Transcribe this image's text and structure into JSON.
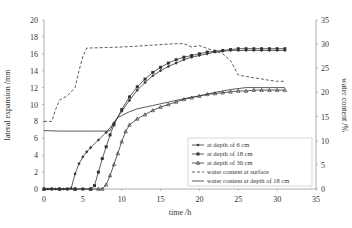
{
  "chart_data": {
    "type": "line",
    "title": "",
    "xlabel": "time /h",
    "ylabel": "lateral expansion /mm",
    "y2label": "water content /%",
    "xlim": [
      0,
      35
    ],
    "ylim": [
      0,
      20
    ],
    "y2lim": [
      0,
      35
    ],
    "xticks": [
      0,
      5,
      10,
      15,
      20,
      25,
      30,
      35
    ],
    "yticks": [
      0,
      2,
      4,
      6,
      8,
      10,
      12,
      14,
      16,
      18,
      20
    ],
    "y2ticks": [
      0,
      5,
      10,
      15,
      20,
      25,
      30,
      35
    ],
    "grid": false,
    "legend_position": "lower right (inside plot)",
    "series": [
      {
        "name": "at depth of 6 cm",
        "axis": "left",
        "style": "solid with diamond markers",
        "x": [
          0,
          0.5,
          1,
          1.5,
          2,
          2.5,
          3,
          3.5,
          4,
          4.5,
          5,
          5.5,
          6,
          7,
          8,
          9,
          10,
          11,
          12,
          13,
          14,
          15,
          16,
          17,
          18,
          19,
          20,
          21,
          22,
          23,
          24,
          25,
          26,
          27,
          28,
          29,
          30,
          31
        ],
        "values": [
          0,
          0,
          0,
          0,
          0,
          0,
          0,
          0.1,
          1.8,
          3.0,
          3.8,
          4.4,
          4.9,
          5.8,
          6.7,
          7.8,
          9.2,
          10.5,
          11.7,
          12.6,
          13.4,
          14.0,
          14.5,
          14.9,
          15.3,
          15.6,
          15.8,
          16.0,
          16.2,
          16.3,
          16.4,
          16.4,
          16.4,
          16.4,
          16.4,
          16.4,
          16.4,
          16.4
        ]
      },
      {
        "name": "at depth of 18 cm",
        "axis": "left",
        "style": "solid with square markers",
        "x": [
          0,
          1,
          2,
          3,
          4,
          5,
          6,
          6.5,
          7,
          7.5,
          8,
          8.5,
          9,
          10,
          11,
          12,
          13,
          14,
          15,
          16,
          17,
          18,
          19,
          20,
          21,
          22,
          23,
          24,
          25,
          26,
          27,
          28,
          29,
          30,
          31
        ],
        "values": [
          0,
          0,
          0,
          0,
          0,
          0,
          0,
          0.4,
          2.0,
          3.6,
          5.0,
          6.4,
          7.6,
          9.4,
          10.9,
          12.1,
          13.0,
          13.8,
          14.4,
          14.9,
          15.3,
          15.6,
          15.8,
          16.0,
          16.2,
          16.3,
          16.4,
          16.5,
          16.6,
          16.6,
          16.6,
          16.6,
          16.6,
          16.6,
          16.6
        ]
      },
      {
        "name": "at depth of 30 cm",
        "axis": "left",
        "style": "solid with triangle markers",
        "x": [
          0,
          2,
          4,
          6,
          7,
          7.5,
          8,
          8.5,
          9,
          9.5,
          10,
          10.5,
          11,
          12,
          13,
          14,
          15,
          16,
          17,
          18,
          19,
          20,
          21,
          22,
          23,
          24,
          25,
          26,
          27,
          28,
          29,
          30,
          31
        ],
        "values": [
          0,
          0,
          0,
          0,
          0,
          0,
          0.5,
          1.6,
          2.9,
          4.2,
          5.6,
          6.8,
          7.6,
          8.3,
          8.8,
          9.3,
          9.7,
          10.0,
          10.3,
          10.6,
          10.8,
          11.0,
          11.2,
          11.3,
          11.4,
          11.5,
          11.6,
          11.6,
          11.7,
          11.7,
          11.7,
          11.7,
          11.7
        ]
      },
      {
        "name": "water content at surface",
        "axis": "right",
        "style": "dashed",
        "x": [
          0,
          1,
          1.5,
          2,
          3,
          4,
          4.5,
          5,
          5.5,
          6,
          8,
          10,
          12,
          14,
          16,
          17,
          18,
          19,
          20,
          21,
          22,
          23,
          24,
          25,
          26,
          27,
          28,
          29,
          30,
          31
        ],
        "values": [
          14.0,
          14.0,
          16.5,
          18.4,
          19.3,
          21.0,
          24.5,
          27.5,
          29.2,
          29.2,
          29.3,
          29.4,
          29.6,
          29.8,
          30.0,
          30.1,
          30.1,
          29.4,
          29.7,
          29.1,
          28.6,
          28.0,
          26.6,
          23.6,
          23.3,
          23.0,
          22.8,
          22.5,
          22.3,
          22.3
        ]
      },
      {
        "name": "water content at depth of 18 cm",
        "axis": "right",
        "style": "solid",
        "x": [
          0,
          2,
          4,
          6,
          8,
          8.5,
          9,
          9.5,
          10,
          11,
          12,
          14,
          16,
          18,
          20,
          22,
          24,
          26,
          28,
          30,
          31
        ],
        "values": [
          12.1,
          12.0,
          12.0,
          12.0,
          12.0,
          12.1,
          13.8,
          14.8,
          15.2,
          16.0,
          16.6,
          17.3,
          18.0,
          18.7,
          19.3,
          20.0,
          20.6,
          21.0,
          21.0,
          21.0,
          21.0
        ]
      }
    ]
  },
  "legend": {
    "items": [
      {
        "label": "at depth of 6 cm",
        "style": "diamond"
      },
      {
        "label": "at depth of 18 cm",
        "style": "square"
      },
      {
        "label": "at depth of 30 cm",
        "style": "triangle"
      },
      {
        "label": "water content at surface",
        "style": "dashed"
      },
      {
        "label": "water content at depth of 18 cm",
        "style": "solid"
      }
    ]
  },
  "colors": {
    "line": "#333333",
    "axis": "#999999",
    "background": "#ffffff"
  }
}
